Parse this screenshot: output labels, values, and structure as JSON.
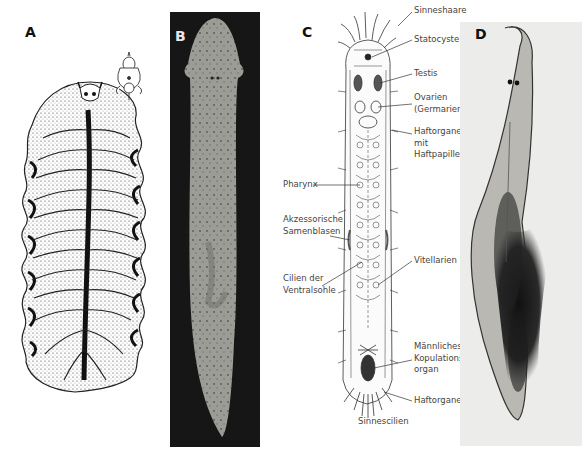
{
  "figure": {
    "panels": [
      {
        "id": "A",
        "letter": "A",
        "description": "drawing of a polyclad flatworm with ruffled margins and small inset drawing"
      },
      {
        "id": "B",
        "letter": "B",
        "description": "photograph of an elongated flatworm on dark background"
      },
      {
        "id": "C",
        "letter": "C",
        "description": "labelled anatomical drawing of a small flatworm"
      },
      {
        "id": "D",
        "letter": "D",
        "description": "micrograph of a planarian flatworm with eyespots"
      }
    ],
    "labels_c": {
      "sinneshaare": "Sinneshaare",
      "statocyste": "Statocyste",
      "testis": "Testis",
      "ovarien_1": "Ovarien",
      "ovarien_2": "(Germarien)",
      "pharynx": "Pharynx",
      "haftorgane_mit_1": "Haftorgane",
      "haftorgane_mit_2": "mit",
      "haftorgane_mit_3": "Haftpapillen",
      "akzessorische_1": "Akzessorische",
      "akzessorische_2": "Samenblasen",
      "vitellarien": "Vitellarien",
      "cilien_1": "Cilien der",
      "cilien_2": "Ventralsohle",
      "maennliches_1": "Männliches",
      "maennliches_2": "Kopulations-",
      "maennliches_3": "organ",
      "haftorgane": "Haftorgane",
      "sinnescilien": "Sinnescilien"
    },
    "colors": {
      "panel_b_bg": "#161616",
      "panel_b_body": "#9a9a94",
      "panel_d_bg": "#ececea",
      "ink": "#1a1a1a"
    }
  }
}
